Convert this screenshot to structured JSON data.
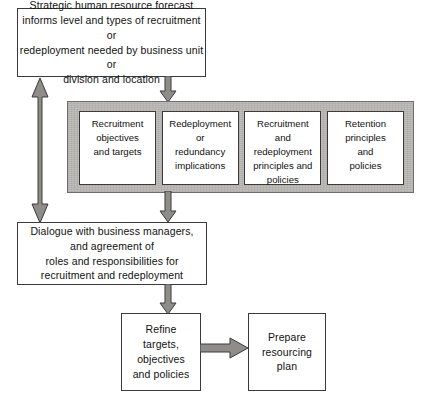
{
  "diagram": {
    "colors": {
      "band_fill": "#b9b7b3",
      "box_fill": "#ffffff",
      "line": "#3a3a3a",
      "arrow_fill": "#8c8c8c",
      "arrow_stroke": "#3a3a3a",
      "text": "#111111"
    }
  },
  "nodes": {
    "forecast": {
      "text": "Strategic human resource forecast\ninforms level and types of recruitment or\nredeployment needed by business unit or\ndivision and location"
    },
    "dialogue": {
      "text": "Dialogue with business managers,\nand agreement of\nroles and responsibilities for\nrecruitment and redeployment"
    },
    "refine": {
      "text": "Refine\ntargets,\nobjectives\nand policies"
    },
    "prepare": {
      "text": "Prepare\nresourcing\nplan"
    }
  },
  "policy_band": {
    "boxes": [
      {
        "text": "Recruitment\nobjectives\nand targets"
      },
      {
        "text": "Redeployment\nor\nredundancy\nimplications"
      },
      {
        "text": "Recruitment\nand\nredeployment\nprinciples and\npolicies"
      },
      {
        "text": "Retention\nprinciples\nand\npolicies"
      }
    ]
  },
  "arrows": [
    {
      "name": "forecast-to-band",
      "direction": "down"
    },
    {
      "name": "band-to-dialogue",
      "direction": "down"
    },
    {
      "name": "dialogue-to-refine",
      "direction": "down"
    },
    {
      "name": "forecast-dialogue-feedback",
      "direction": "both"
    },
    {
      "name": "refine-to-prepare",
      "direction": "right"
    }
  ]
}
